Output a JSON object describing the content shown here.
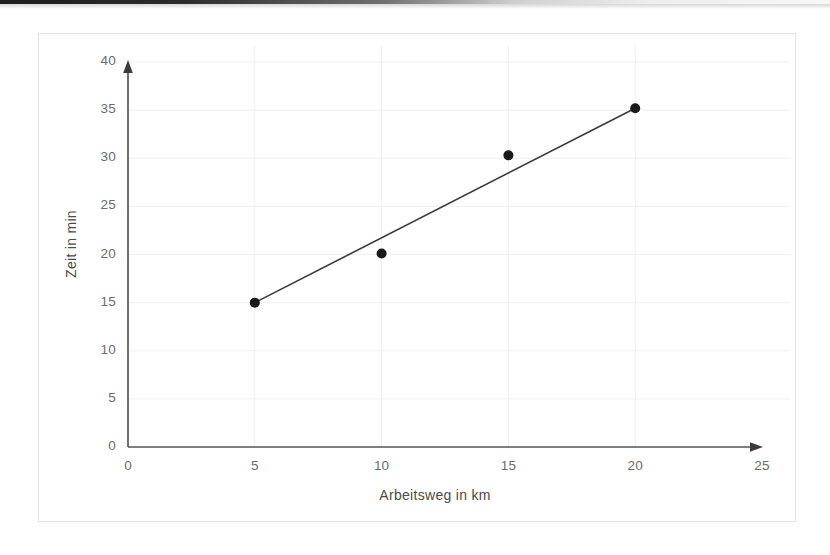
{
  "chart_data": {
    "type": "scatter",
    "title": "",
    "subtitle": "",
    "xlabel": "Arbeitsweg in km",
    "ylabel": "Zeit in min",
    "x": [
      5,
      10,
      15,
      20
    ],
    "values": [
      15.0,
      20.1,
      30.3,
      35.2
    ],
    "series": [
      {
        "name": "Messpunkte",
        "x": [
          5,
          10,
          15,
          20
        ],
        "values": [
          15.0,
          20.1,
          30.3,
          35.2
        ]
      },
      {
        "name": "Ausgleichsgerade",
        "type": "line",
        "x": [
          5,
          20
        ],
        "values": [
          15.0,
          35.2
        ]
      }
    ],
    "xlim": [
      0,
      25
    ],
    "ylim": [
      0,
      40
    ],
    "xticks": [
      "0",
      "5",
      "10",
      "15",
      "20",
      "25"
    ],
    "yticks": [
      "0",
      "5",
      "10",
      "15",
      "20",
      "25",
      "30",
      "35",
      "40"
    ],
    "xtick_values": [
      0,
      5,
      10,
      15,
      20,
      25
    ],
    "ytick_values": [
      0,
      5,
      10,
      15,
      20,
      25,
      30,
      35,
      40
    ],
    "grid": true,
    "grid_color": "#f0f0f0",
    "legend": false,
    "legend_position": "none",
    "axis_arrows": true,
    "marker_color": "#1a1a1a",
    "line_color": "#3a3a3a",
    "axis_color": "#555555",
    "frame_color": "#e3e3e3",
    "background": "#ffffff",
    "annotations": []
  },
  "axes": {
    "x_title": "Arbeitsweg in km",
    "y_title": "Zeit in min"
  }
}
